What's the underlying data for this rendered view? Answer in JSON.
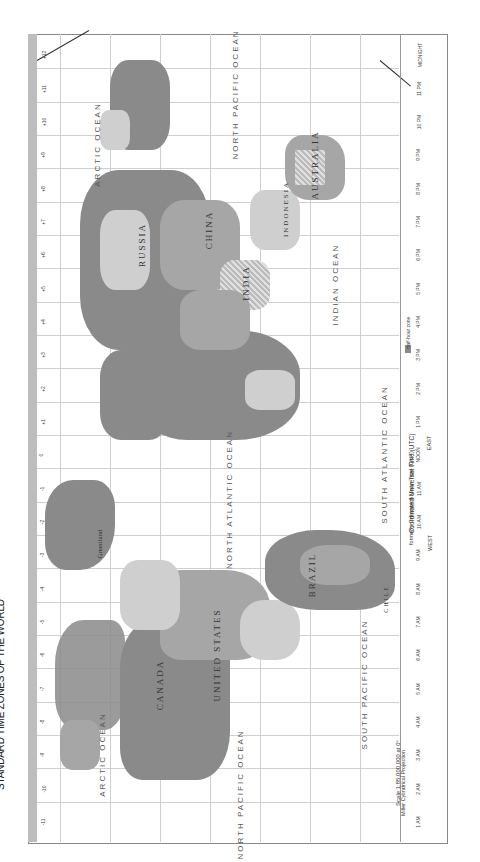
{
  "map": {
    "title": "STANDARD TIME ZONES OF THE WORLD",
    "oceans": [
      {
        "name": "ARCTIC OCEAN",
        "x": 80,
        "y": 760
      },
      {
        "name": "ARCTIC OCEAN",
        "x": 72,
        "y": 150
      },
      {
        "name": "NORTH PACIFIC OCEAN",
        "x": 200,
        "y": 800
      },
      {
        "name": "NORTH PACIFIC OCEAN",
        "x": 200,
        "y": 100
      },
      {
        "name": "SOUTH PACIFIC OCEAN",
        "x": 330,
        "y": 690
      },
      {
        "name": "NORTH ATLANTIC OCEAN",
        "x": 195,
        "y": 505
      },
      {
        "name": "SOUTH ATLANTIC OCEAN",
        "x": 350,
        "y": 460
      },
      {
        "name": "INDIAN OCEAN",
        "x": 320,
        "y": 290
      }
    ],
    "countries": [
      {
        "name": "CANADA",
        "x": 160,
        "y": 690
      },
      {
        "name": "UNITED STATES",
        "x": 200,
        "y": 660
      },
      {
        "name": "BRAZIL",
        "x": 300,
        "y": 580
      },
      {
        "name": "RUSSIA",
        "x": 140,
        "y": 250
      },
      {
        "name": "CHINA",
        "x": 205,
        "y": 235
      },
      {
        "name": "INDIA",
        "x": 240,
        "y": 285
      },
      {
        "name": "AUSTRALIA",
        "x": 300,
        "y": 165
      },
      {
        "name": "INDONESIA",
        "x": 280,
        "y": 210
      },
      {
        "name": "Greenland",
        "x": 95,
        "y": 545
      },
      {
        "name": "CHILE",
        "x": 380,
        "y": 600
      }
    ],
    "zone_offsets_top": [
      "-11",
      "-10",
      "-9",
      "-8",
      "-7",
      "-6",
      "-5",
      "-4",
      "-3",
      "-2",
      "-1",
      "0",
      "+1",
      "+2",
      "+3",
      "+4",
      "+5",
      "+6",
      "+7",
      "+8",
      "+9",
      "+10",
      "+11",
      "+12"
    ],
    "time_strip": [
      "1 AM",
      "2 AM",
      "3 AM",
      "4 AM",
      "5 AM",
      "6 AM",
      "7 AM",
      "8 AM",
      "9 AM",
      "10 AM",
      "11 AM",
      "NOON",
      "1 PM",
      "2 PM",
      "3 PM",
      "4 PM",
      "5 PM",
      "6 PM",
      "7 PM",
      "8 PM",
      "9 PM",
      "10 PM",
      "11 PM",
      "MIDNIGHT"
    ],
    "legend": {
      "title": "Coordinated Universal Time (UTC)",
      "subtitle": "formerly Greenwich Mean Time (GMT)",
      "west_label": "WEST",
      "east_label": "EAST",
      "half_hour_label": "Half-hour zone",
      "no_standard_label": "No standard time"
    },
    "scale": {
      "text": "Scale 1:85,000,000 at 0°",
      "projection": "Miller Cylindrical Projection"
    },
    "lines": {
      "dateline": "International Date Line"
    }
  }
}
